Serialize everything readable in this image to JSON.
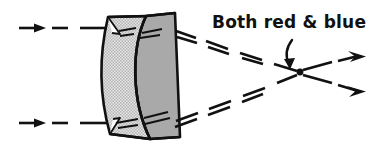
{
  "figure": {
    "background_color": "#ffffff",
    "ink_color": "#111111",
    "width": 381,
    "height": 147
  },
  "annotation": {
    "label": "Both red & blue",
    "label_x": 212,
    "label_y": 25,
    "pointer": "curved-down-arrow",
    "pointer_target_x": 300,
    "pointer_target_y": 72
  },
  "lens": {
    "name": "achromatic-doublet",
    "front_element": {
      "name": "biconvex-element",
      "fill_color": "#d8d8d8",
      "fill_pattern": "stipple",
      "stroke_color": "#111111"
    },
    "rear_element": {
      "name": "plano-concave-element",
      "fill_color": "#a9a9a9",
      "fill_pattern": "solid",
      "stroke_color": "#111111"
    },
    "top_edge_y": 13,
    "bottom_edge_y": 137,
    "left_x": 104,
    "right_x": 180
  },
  "rays": {
    "incoming": [
      {
        "name": "incoming-ray-top",
        "y": 28,
        "x_start": 18,
        "x_end": 108,
        "style": "dashed-with-arrowhead"
      },
      {
        "name": "incoming-ray-bottom",
        "y": 123,
        "x_start": 18,
        "x_end": 108,
        "style": "dashed-with-arrowhead"
      }
    ],
    "refracted": [
      {
        "name": "refracted-ray-top-red",
        "from_x": 176,
        "from_y": 30,
        "to_x": 300,
        "to_y": 72
      },
      {
        "name": "refracted-ray-top-blue",
        "from_x": 176,
        "from_y": 36,
        "to_x": 300,
        "to_y": 72
      },
      {
        "name": "refracted-ray-bottom-red",
        "from_x": 176,
        "from_y": 120,
        "to_x": 300,
        "to_y": 72
      },
      {
        "name": "refracted-ray-bottom-blue",
        "from_x": 176,
        "from_y": 126,
        "to_x": 300,
        "to_y": 72
      }
    ],
    "diverging": [
      {
        "name": "diverging-ray-upper",
        "from_x": 300,
        "from_y": 72,
        "to_x": 370,
        "to_y": 58
      },
      {
        "name": "diverging-ray-lower",
        "from_x": 300,
        "from_y": 72,
        "to_x": 372,
        "to_y": 90
      }
    ]
  },
  "focal_point": {
    "name": "focal-point",
    "x": 300,
    "y": 72,
    "radius": 3.2,
    "color": "#111111"
  }
}
